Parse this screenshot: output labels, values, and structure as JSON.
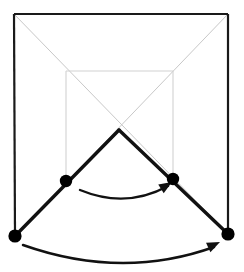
{
  "figure": {
    "canvas": {
      "width": 244,
      "height": 272,
      "background": "#ffffff"
    },
    "colors": {
      "frame_dark": "#1a1a1a",
      "guide_gray": "#c8c8c8",
      "inner_gray": "#d2d2d2",
      "link_dark": "#111111",
      "joint_fill": "#000000",
      "arrow": "#111111"
    },
    "stroke_widths": {
      "frame": 2.2,
      "guide": 1.0,
      "inner_square": 1.1,
      "link": 3.4,
      "arc": 2.4
    },
    "outer_frame": {
      "label": "outer fixed frame",
      "top_left": {
        "x": 14,
        "y": 14
      },
      "top_right": {
        "x": 228,
        "y": 14
      },
      "bottom_left": {
        "x": 15,
        "y": 236
      },
      "bottom_right": {
        "x": 228,
        "y": 234
      },
      "has_bottom_edge": false
    },
    "inner_square": {
      "label": "inner reference square",
      "top_left": {
        "x": 66,
        "y": 71
      },
      "top_right": {
        "x": 173,
        "y": 71
      },
      "bottom_left": {
        "x": 66,
        "y": 181
      },
      "bottom_right": {
        "x": 173,
        "y": 179
      },
      "has_bottom_edge": false
    },
    "guide_diagonals": [
      {
        "name": "diagonal-tl-to-br",
        "x1": 14,
        "y1": 14,
        "x2": 228,
        "y2": 234
      },
      {
        "name": "diagonal-tr-to-bl",
        "x1": 228,
        "y1": 14,
        "x2": 15,
        "y2": 236
      }
    ],
    "links": [
      {
        "name": "link-left-arm",
        "x1": 15,
        "y1": 236,
        "x2": 119,
        "y2": 130
      },
      {
        "name": "link-right-arm",
        "x1": 119,
        "y1": 130,
        "x2": 228,
        "y2": 234
      }
    ],
    "crossing_point": {
      "x": 119,
      "y": 130
    },
    "joints": [
      {
        "name": "joint-inner-left",
        "x": 66,
        "y": 181,
        "r": 6.2
      },
      {
        "name": "joint-inner-right",
        "x": 173,
        "y": 179,
        "r": 6.2
      },
      {
        "name": "joint-outer-left",
        "x": 15,
        "y": 236,
        "r": 6.6
      },
      {
        "name": "joint-outer-right",
        "x": 228,
        "y": 234,
        "r": 6.6
      }
    ],
    "arcs": [
      {
        "name": "arc-inner-rotation",
        "path": "M 80 190 Q 126 209 168 186",
        "direction": "left-to-right",
        "arrow_tip": {
          "x": 172,
          "y": 182
        },
        "arrow_angle_deg": -32
      },
      {
        "name": "arc-outer-rotation",
        "path": "M 23 245 Q 122 280 214 247",
        "direction": "left-to-right",
        "arrow_tip": {
          "x": 220,
          "y": 242
        },
        "arrow_angle_deg": -25
      }
    ]
  }
}
